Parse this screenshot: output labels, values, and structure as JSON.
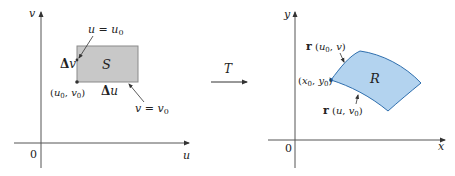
{
  "left_panel": {
    "axis_v_label": "v",
    "axis_u_label": "u",
    "origin_label": "0",
    "region_label": "S",
    "delta_v": {
      "delta": "Δ",
      "var": "v"
    },
    "delta_u": {
      "delta": "Δ",
      "var": "u"
    },
    "corner_point": {
      "open": "(",
      "a": "u",
      "a_sub": "0",
      "sep": ", ",
      "b": "v",
      "b_sub": "0",
      "close": ")"
    },
    "line_u_eq": {
      "lhs": "u",
      "eq": " = ",
      "rhs": "u",
      "rhs_sub": "0"
    },
    "line_v_eq": {
      "lhs": "v",
      "eq": " = ",
      "rhs": "v",
      "rhs_sub": "0"
    },
    "region_fill": "#c8c8c8",
    "region_stroke": "#8a8a8a"
  },
  "transform": {
    "label": "T"
  },
  "right_panel": {
    "axis_y_label": "y",
    "axis_x_label": "x",
    "origin_label": "0",
    "region_label": "R",
    "point": {
      "open": "(",
      "a": "x",
      "a_sub": "0",
      "sep": ", ",
      "b": "y",
      "b_sub": "0",
      "close": ")"
    },
    "curve_upper": {
      "fn": "r",
      "open": " (",
      "a": "u",
      "a_sub": "0",
      "sep": ", ",
      "b": "v",
      "close": ")"
    },
    "curve_lower": {
      "fn": "r",
      "open": " (",
      "a": "u",
      "sep": ", ",
      "b": "v",
      "b_sub": "0",
      "close": ")"
    },
    "region_fill": "#b3d3ef",
    "region_stroke": "#2f6fae"
  }
}
